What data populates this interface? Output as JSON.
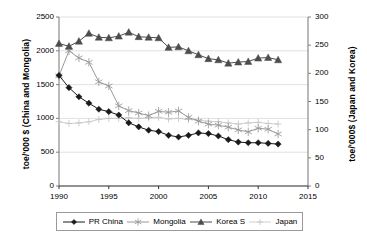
{
  "chart_data": {
    "type": "line",
    "title": "",
    "xlabel": "",
    "ylabel": "toe/'000 $ (China and Mongolia)",
    "ylabel_secondary": "toe/'000$ (Japan and Korea)",
    "xlim": [
      1990,
      2015
    ],
    "ylim": [
      0,
      2500
    ],
    "ylim_secondary": [
      0,
      300
    ],
    "xticks": [
      "1990",
      "1995",
      "2000",
      "2005",
      "2010",
      "2015"
    ],
    "yticks": [
      "0",
      "500",
      "1000",
      "1500",
      "2000",
      "2500"
    ],
    "yticks_secondary": [
      "0",
      "50",
      "100",
      "150",
      "200",
      "250",
      "300"
    ],
    "grid": true,
    "legend_position": "bottom",
    "x": [
      1990,
      1991,
      1992,
      1993,
      1994,
      1995,
      1996,
      1997,
      1998,
      1999,
      2000,
      2001,
      2002,
      2003,
      2004,
      2005,
      2006,
      2007,
      2008,
      2009,
      2010,
      2011,
      2012
    ],
    "series": [
      {
        "name": "PR China",
        "axis": "left",
        "marker": "diamond",
        "color": "#1a1a1a",
        "values": [
          1635,
          1455,
          1320,
          1225,
          1135,
          1100,
          1050,
          935,
          875,
          825,
          805,
          750,
          725,
          750,
          785,
          775,
          740,
          685,
          650,
          640,
          640,
          630,
          620
        ]
      },
      {
        "name": "Mongolia",
        "axis": "left",
        "marker": "asterisk",
        "color": "#9a9a9a",
        "values": [
          1630,
          2000,
          1895,
          1830,
          1540,
          1480,
          1185,
          1115,
          1080,
          1040,
          1105,
          1090,
          1110,
          1015,
          960,
          915,
          900,
          870,
          830,
          800,
          855,
          840,
          770
        ]
      },
      {
        "name": "Korea S",
        "axis": "right",
        "marker": "triangle",
        "color": "#4d4d4d",
        "values": [
          253,
          248,
          257,
          271,
          264,
          263,
          266,
          273,
          265,
          264,
          263,
          246,
          247,
          240,
          233,
          226,
          224,
          218,
          220,
          221,
          227,
          228,
          224
        ]
      },
      {
        "name": "Japan",
        "axis": "right",
        "marker": "plus",
        "color": "#c4c4c4",
        "values": [
          114,
          111,
          112,
          114,
          118,
          120,
          120,
          121,
          120,
          121,
          122,
          119,
          120,
          118,
          117,
          115,
          114,
          112,
          110,
          112,
          113,
          111,
          110
        ]
      }
    ]
  },
  "legend": {
    "items": [
      {
        "label": "PR China"
      },
      {
        "label": "Mongolia"
      },
      {
        "label": "Korea S"
      },
      {
        "label": "Japan"
      }
    ]
  }
}
